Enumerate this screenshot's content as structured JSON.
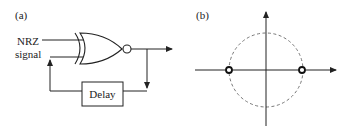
{
  "panel_a": {
    "label": "(a)",
    "input_label_line1": "NRZ",
    "input_label_line2": "signal",
    "gate_type": "XNOR",
    "delay_label": "Delay"
  },
  "panel_b": {
    "label": "(b)",
    "circle_style": "dashed",
    "points": [
      {
        "name": "left-point",
        "x": -1,
        "y": 0
      },
      {
        "name": "right-point",
        "x": 1,
        "y": 0
      }
    ]
  },
  "colors": {
    "line": "#222222",
    "dashed_circle": "#777777",
    "background": "#ffffff"
  }
}
